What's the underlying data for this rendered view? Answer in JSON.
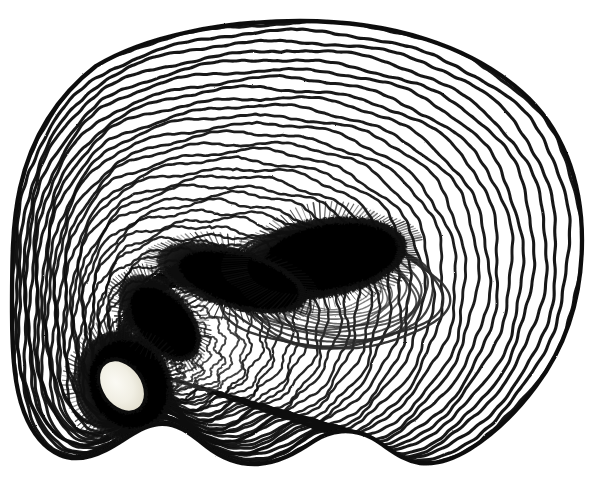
{
  "figure": {
    "kind": "scientific-engraving",
    "alt_text": "Engraved cross-section with concentric rings around a dark hook and a light oval nucleus",
    "title": "",
    "caption": "",
    "label": ""
  },
  "canvas": {
    "width": 606,
    "height": 490,
    "background_color": "#ffffff"
  },
  "palette": {
    "ink": "#111111",
    "ink_soft": "#2a2a2a",
    "ink_faint": "#5a5a5a",
    "paper": "#ffffff",
    "hilum_fill": "#f1efe4",
    "hilum_shade": "#ddd9c8",
    "core_black": "#0a0a0a"
  },
  "geometry": {
    "outline": {
      "comment": "Outer boundary of the specimen; rounded dome on top, wavy undulating base.",
      "center": [
        300,
        243
      ],
      "leftmost_x": 12,
      "rightmost_x": 582,
      "topmost_y": 20,
      "bottommost_y": 466,
      "path": "M 300 21 C 392 21 470 46 522 92 C 562 127 582 180 582 240 C 582 296 566 346 536 386 C 516 413 492 435 470 449 C 452 460 436 465 420 463 C 400 460 388 447 372 438 C 352 427 330 430 314 441 C 296 453 278 463 258 464 C 238 465 220 457 206 446 C 190 433 176 422 158 424 C 140 426 124 441 106 450 C 90 458 74 461 60 455 C 44 448 32 433 24 412 C 15 388 12 358 12 312 C 12 262 12 224 20 188 C 31 139 56 97 96 66 C 146 36 222 21 300 21 Z"
    },
    "core": {
      "comment": "Dark comma / hook-shaped mass occupying the mid-left to centre of the figure, tapering to a point at the right.",
      "path": "M 400 245 C 398 275 380 296 352 308 C 318 322 272 322 230 310 C 196 300 168 300 146 312 C 126 323 112 344 106 366 C 102 382 100 400 104 416 C 108 432 118 444 130 450 C 140 455 148 451 148 442 C 148 432 140 424 134 412 C 128 398 128 382 134 368 C 142 348 158 334 178 328 C 200 321 224 326 250 332 C 290 341 330 337 360 322 C 390 307 404 280 406 248 C 407 236 402 232 400 245 Z",
      "core_blob": "M 396 222 C 396 256 372 282 330 294 C 292 305 248 302 214 292 C 186 284 168 286 156 296 C 140 309 128 334 124 356 C 120 378 124 396 134 406 C 120 394 112 374 114 350 C 117 320 132 292 154 276 C 176 260 206 256 236 260 C 268 264 300 262 326 250 C 352 238 368 220 376 200 C 384 182 392 186 394 202 Z",
      "tail_tip": [
        406,
        246
      ],
      "thick_head": [
        280,
        258
      ]
    },
    "hilum": {
      "comment": "Pale oval nucleus embedded in the dark mass at lower-left.",
      "center": [
        122,
        386
      ],
      "rx": 19,
      "ry": 27,
      "rotation_deg": -35,
      "fill": "#f1efe4"
    },
    "rings": {
      "comment": "Concentric growth striations; drawn as nested closed curves between the hilum and the outline.",
      "count": 44,
      "stroke_width_outer": 3.2,
      "stroke_width_inner": 1.6,
      "spacing_px": 9.5,
      "focus": [
        150,
        372
      ]
    },
    "inner_swirl": {
      "comment": "Tight swirl of striations wrapping around the right lobe of the dark core.",
      "count": 16,
      "center": [
        330,
        290
      ],
      "rx": 110,
      "ry": 62,
      "rotation_deg": -8
    }
  },
  "rendering": {
    "style": "line engraving / copperplate hatching",
    "medium": "black ink on white paper",
    "line_count_estimate": 60,
    "texture": "stippled edges, irregular hand-cut lines"
  }
}
